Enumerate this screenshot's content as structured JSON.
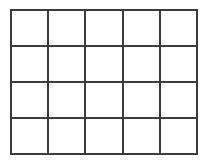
{
  "figure": {
    "name": "empty-grid",
    "type": "grid",
    "rows": 4,
    "columns": 5,
    "cell_count": 20,
    "cell_label": "",
    "line_color": "#3c3c3c",
    "line_width_px": 2,
    "background_color": "#ffffff",
    "canvas": {
      "width_px": 210,
      "height_px": 165
    },
    "bounds": {
      "left_px": 10,
      "top_px": 9,
      "right_px": 198,
      "bottom_px": 155,
      "width_px": 188,
      "height_px": 146
    },
    "column_boundaries_px": [
      10,
      48,
      86,
      124,
      162,
      198
    ],
    "row_boundaries_px": [
      9,
      45,
      82,
      118,
      155
    ],
    "cells": [
      {
        "row": 1,
        "column": 1,
        "label": ""
      },
      {
        "row": 1,
        "column": 2,
        "label": ""
      },
      {
        "row": 1,
        "column": 3,
        "label": ""
      },
      {
        "row": 1,
        "column": 4,
        "label": ""
      },
      {
        "row": 1,
        "column": 5,
        "label": ""
      },
      {
        "row": 2,
        "column": 1,
        "label": ""
      },
      {
        "row": 2,
        "column": 2,
        "label": ""
      },
      {
        "row": 2,
        "column": 3,
        "label": ""
      },
      {
        "row": 2,
        "column": 4,
        "label": ""
      },
      {
        "row": 2,
        "column": 5,
        "label": ""
      },
      {
        "row": 3,
        "column": 1,
        "label": ""
      },
      {
        "row": 3,
        "column": 2,
        "label": ""
      },
      {
        "row": 3,
        "column": 3,
        "label": ""
      },
      {
        "row": 3,
        "column": 4,
        "label": ""
      },
      {
        "row": 3,
        "column": 5,
        "label": ""
      },
      {
        "row": 4,
        "column": 1,
        "label": ""
      },
      {
        "row": 4,
        "column": 2,
        "label": ""
      },
      {
        "row": 4,
        "column": 3,
        "label": ""
      },
      {
        "row": 4,
        "column": 4,
        "label": ""
      },
      {
        "row": 4,
        "column": 5,
        "label": ""
      }
    ]
  }
}
